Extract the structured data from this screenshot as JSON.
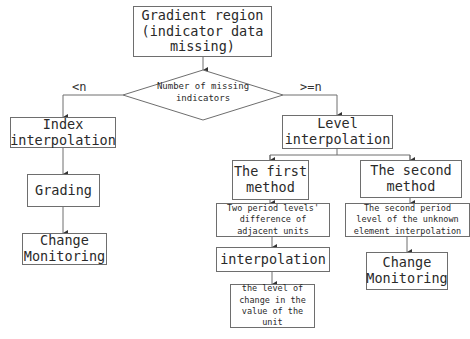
{
  "diagram": {
    "type": "flowchart",
    "nodes": {
      "start": "Gradient region\n(indicator data\nmissing)",
      "decision": "Number of missing\nindicators",
      "index_interp": "Index\ninterpolation",
      "grading": "Grading",
      "change_left": "Change\nMonitoring",
      "level_interp": "Level\ninterpolation",
      "first_method": "The first\nmethod",
      "second_method": "The second\nmethod",
      "two_period": "Two period levels'\ndifference of\nadjacent units",
      "interpolation": "interpolation",
      "level_change": "the level of\nchange in the\nvalue of the\nunit",
      "second_period": "The second period\nlevel of the unknown\nelement interpolation",
      "change_right": "Change\nMonitoring"
    },
    "edge_labels": {
      "less": "<n",
      "greater_equal": ">=n"
    },
    "colors": {
      "line": "#6e6e6e",
      "text": "#2a2a2a",
      "background": "#ffffff"
    }
  }
}
